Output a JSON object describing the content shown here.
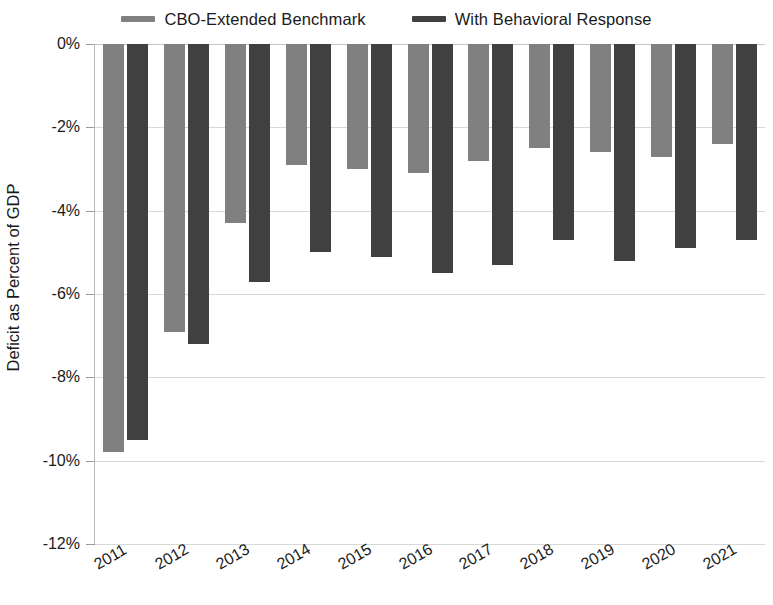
{
  "chart_data": {
    "type": "bar",
    "title": "",
    "xlabel": "",
    "ylabel": "Deficit as Percent of GDP",
    "categories": [
      "2011",
      "2012",
      "2013",
      "2014",
      "2015",
      "2016",
      "2017",
      "2018",
      "2019",
      "2020",
      "2021"
    ],
    "series": [
      {
        "name": "CBO-Extended Benchmark",
        "color": "#808080",
        "values": [
          -9.8,
          -6.9,
          -4.3,
          -2.9,
          -3.0,
          -3.1,
          -2.8,
          -2.5,
          -2.6,
          -2.7,
          -2.4
        ]
      },
      {
        "name": "With Behavioral Response",
        "color": "#404040",
        "values": [
          -9.5,
          -7.2,
          -5.7,
          -5.0,
          -5.1,
          -5.5,
          -5.3,
          -4.7,
          -5.2,
          -4.9,
          -4.7
        ]
      }
    ],
    "ylim": [
      -12,
      0
    ],
    "yticks": [
      0,
      -2,
      -4,
      -6,
      -8,
      -10,
      -12
    ],
    "ytick_labels": [
      "0%",
      "-2%",
      "-4%",
      "-6%",
      "-8%",
      "-10%",
      "-12%"
    ],
    "grid": true,
    "legend_position": "top"
  },
  "legend": {
    "entries": [
      {
        "label": "CBO-Extended Benchmark",
        "swatch": "legend-swatch-light"
      },
      {
        "label": "With Behavioral Response",
        "swatch": "legend-swatch-dark"
      }
    ]
  }
}
